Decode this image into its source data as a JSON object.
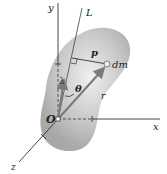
{
  "diagram": {
    "labels": {
      "y_axis": "y",
      "x_axis": "x",
      "z_axis": "z",
      "axis_L": "L",
      "origin": "O",
      "mass_element": "dm",
      "perpendicular_distance": "p",
      "unit_vector": "λ",
      "angle": "θ",
      "position_vector": "r"
    },
    "colors": {
      "body_fill": "#b9b9b9",
      "body_highlight": "#e6e6e6",
      "vector": "#7a7a7a",
      "line": "#333333"
    }
  }
}
